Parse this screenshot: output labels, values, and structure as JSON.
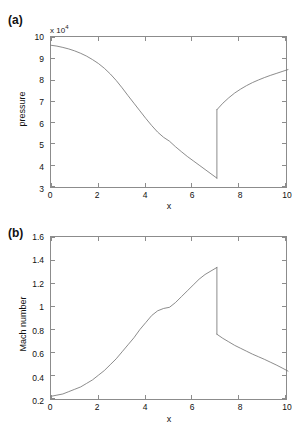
{
  "figure": {
    "background": "#ffffff",
    "line_color": "#6e6e6e",
    "axis_color": "#8c8c8c"
  },
  "panels": [
    {
      "label": "(a)",
      "exponent_prefix": "x 10",
      "exponent_power": "4",
      "ylabel": "pressure",
      "xlabel": "x",
      "yticks": [
        "3",
        "4",
        "5",
        "6",
        "7",
        "8",
        "9",
        "10"
      ],
      "xticks": [
        "0",
        "2",
        "4",
        "6",
        "8",
        "10"
      ]
    },
    {
      "label": "(b)",
      "exponent_prefix": "",
      "exponent_power": "",
      "ylabel": "Mach number",
      "xlabel": "x",
      "yticks": [
        "0.2",
        "0.4",
        "0.6",
        "0.8",
        "1",
        "1.2",
        "1.4",
        "1.6"
      ],
      "xticks": [
        "0",
        "2",
        "4",
        "6",
        "8",
        "10"
      ]
    }
  ],
  "chart_data": [
    {
      "type": "line",
      "title": "(a)",
      "xlabel": "x",
      "ylabel": "pressure",
      "y_exponent": "x 10^4",
      "xlim": [
        0,
        10
      ],
      "ylim": [
        3,
        10
      ],
      "grid": false,
      "legend": "none",
      "annotations": [
        "normal shock discontinuity at x = 7"
      ],
      "series": [
        {
          "name": "pressure",
          "x": [
            0,
            0.25,
            0.5,
            0.75,
            1,
            1.25,
            1.5,
            1.75,
            2,
            2.25,
            2.5,
            2.75,
            3,
            3.25,
            3.5,
            3.75,
            4,
            4.25,
            4.5,
            4.75,
            5,
            5.25,
            5.5,
            5.75,
            6,
            6.25,
            6.5,
            6.75,
            7
          ],
          "values": [
            9.62,
            9.58,
            9.52,
            9.45,
            9.36,
            9.25,
            9.12,
            8.96,
            8.78,
            8.56,
            8.3,
            8.0,
            7.66,
            7.3,
            6.95,
            6.6,
            6.25,
            5.92,
            5.62,
            5.38,
            5.2,
            4.95,
            4.72,
            4.5,
            4.3,
            4.1,
            3.9,
            3.7,
            3.5
          ]
        },
        {
          "name": "pressure_post_shock",
          "x": [
            7,
            7.25,
            7.5,
            7.75,
            8,
            8.25,
            8.5,
            8.75,
            9,
            9.25,
            9.5,
            9.75,
            10
          ],
          "values": [
            6.65,
            6.95,
            7.2,
            7.42,
            7.6,
            7.76,
            7.9,
            8.02,
            8.13,
            8.23,
            8.32,
            8.41,
            8.5
          ]
        }
      ]
    },
    {
      "type": "line",
      "title": "(b)",
      "xlabel": "x",
      "ylabel": "Mach number",
      "xlim": [
        0,
        10
      ],
      "ylim": [
        0.2,
        1.6
      ],
      "grid": false,
      "legend": "none",
      "annotations": [
        "sonic point M = 1 at x = 5",
        "normal shock discontinuity at x = 7"
      ],
      "series": [
        {
          "name": "mach_subsonic_to_supersonic",
          "x": [
            0,
            0.25,
            0.5,
            0.75,
            1,
            1.25,
            1.5,
            1.75,
            2,
            2.25,
            2.5,
            2.75,
            3,
            3.25,
            3.5,
            3.75,
            4,
            4.25,
            4.5,
            4.75,
            5,
            5.25,
            5.5,
            5.75,
            6,
            6.25,
            6.5,
            6.75,
            7
          ],
          "values": [
            0.24,
            0.25,
            0.26,
            0.28,
            0.3,
            0.32,
            0.35,
            0.38,
            0.42,
            0.46,
            0.51,
            0.56,
            0.62,
            0.68,
            0.74,
            0.81,
            0.87,
            0.93,
            0.97,
            0.99,
            1.0,
            1.04,
            1.09,
            1.14,
            1.19,
            1.24,
            1.28,
            1.31,
            1.34
          ]
        },
        {
          "name": "mach_post_shock",
          "x": [
            7,
            7.25,
            7.5,
            7.75,
            8,
            8.25,
            8.5,
            8.75,
            9,
            9.25,
            9.5,
            9.75,
            10
          ],
          "values": [
            0.77,
            0.735,
            0.705,
            0.675,
            0.65,
            0.625,
            0.6,
            0.578,
            0.556,
            0.532,
            0.508,
            0.482,
            0.455
          ]
        }
      ]
    }
  ]
}
